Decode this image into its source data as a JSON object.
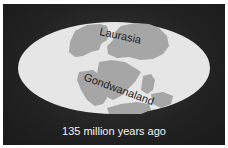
{
  "figure": {
    "caption": "135 million years ago",
    "labels": {
      "northern": "Laurasia",
      "southern": "Gondwanaland"
    },
    "colors": {
      "background": "#222222",
      "ocean": "#e6e6e6",
      "land": "#a6a6a6",
      "label_text": "#1e1e1e",
      "caption_text": "#f2f2f2"
    }
  }
}
